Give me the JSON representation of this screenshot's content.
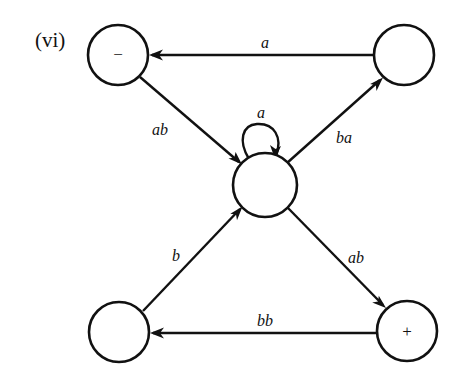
{
  "panel_label": "(vi)",
  "nodes": {
    "top_left": {
      "label": "−",
      "role": "start",
      "cx": 118,
      "cy": 55
    },
    "top_right": {
      "label": "",
      "cx": 404,
      "cy": 55
    },
    "center": {
      "label": "",
      "cx": 265,
      "cy": 185
    },
    "bottom_left": {
      "label": "",
      "cx": 119,
      "cy": 332
    },
    "bottom_right": {
      "label": "+",
      "role": "final",
      "cx": 407,
      "cy": 331
    }
  },
  "edges": {
    "top_right_to_top_left": {
      "from": "top_right",
      "to": "top_left",
      "label": "a"
    },
    "top_left_to_center": {
      "from": "top_left",
      "to": "center",
      "label": "ab"
    },
    "center_loop": {
      "from": "center",
      "to": "center",
      "label": "a"
    },
    "center_to_top_right": {
      "from": "center",
      "to": "top_right",
      "label": "ba"
    },
    "bottom_left_to_center": {
      "from": "bottom_left",
      "to": "center",
      "label": "b"
    },
    "center_to_bottom_right": {
      "from": "center",
      "to": "bottom_right",
      "label": "ab"
    },
    "bottom_right_to_bottom_left": {
      "from": "bottom_right",
      "to": "bottom_left",
      "label": "bb"
    }
  }
}
